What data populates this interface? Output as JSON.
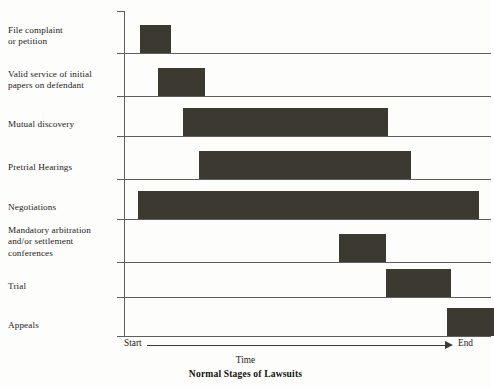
{
  "chart_data": {
    "type": "bar",
    "orientation": "horizontal-gantt",
    "title": "Normal Stages of Lawsuits",
    "xlabel": "Time",
    "ylabel": "",
    "x_axis_start_label": "Start",
    "x_axis_end_label": "End",
    "xlim": [
      0,
      100
    ],
    "grid": "horizontal-baselines-only",
    "legend": "none",
    "bar_color": "#3c3931",
    "axis_color": "#5e5e5e",
    "categories": [
      "File complaint or petition",
      "Valid service of initial papers on defendant",
      "Mutual discovery",
      "Pretrial Hearings",
      "Negotiations",
      "Mandatory arbitration and/or settlement conferences",
      "Trial",
      "Appeals"
    ],
    "bars": [
      {
        "label": "File complaint or petition",
        "start": 4.5,
        "end": 13.0
      },
      {
        "label": "Valid service of initial papers on defendant",
        "start": 9.5,
        "end": 22.5
      },
      {
        "label": "Mutual discovery",
        "start": 16.5,
        "end": 73.5
      },
      {
        "label": "Pretrial Hearings",
        "start": 21.0,
        "end": 80.0
      },
      {
        "label": "Negotiations",
        "start": 4.0,
        "end": 99.0
      },
      {
        "label": "Mandatory arbitration and/or settlement conferences",
        "start": 60.0,
        "end": 73.0
      },
      {
        "label": "Trial",
        "start": 73.0,
        "end": 91.0
      },
      {
        "label": "Appeals",
        "start": 90.0,
        "end": 103.0
      }
    ]
  },
  "labels": {
    "row0_line1": "File complaint",
    "row0_line2": "or petition",
    "row1_line1": "Valid service of initial",
    "row1_line2": "papers on defendant",
    "row2_line1": "Mutual discovery",
    "row3_line1": "Pretrial Hearings",
    "row4_line1": "Negotiations",
    "row5_line1": "Mandatory arbitration",
    "row5_line2": "and/or settlement",
    "row5_line3": "conferences",
    "row6_line1": "Trial",
    "row7_line1": "Appeals"
  },
  "axis": {
    "start": "Start",
    "end": "End",
    "time": "Time",
    "title": "Normal Stages of Lawsuits"
  }
}
